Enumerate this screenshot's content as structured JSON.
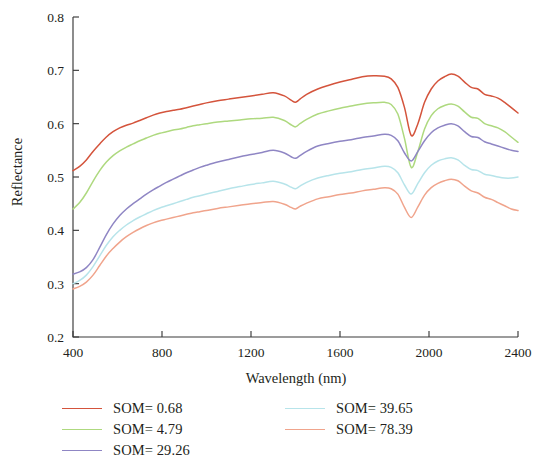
{
  "figure": {
    "background": "#ffffff"
  },
  "axes": {
    "x": {
      "label": "Wavelength (nm)",
      "ticks": [
        400,
        800,
        1200,
        1600,
        2000,
        2400
      ],
      "tick_labels": [
        "400",
        "800",
        "1200",
        "1600",
        "2000",
        "2400"
      ],
      "min": 400,
      "max": 2400
    },
    "y": {
      "label": "Reflectance",
      "ticks": [
        0.2,
        0.3,
        0.4,
        0.5,
        0.6,
        0.7,
        0.8
      ],
      "tick_labels": [
        "0.2",
        "0.3",
        "0.4",
        "0.5",
        "0.6",
        "0.7",
        "0.8"
      ],
      "min": 0.2,
      "max": 0.8
    }
  },
  "legend": {
    "position": "bottom",
    "columns": 2,
    "left_column": [
      {
        "label": "SOM= 0.68",
        "color": "#d4543c",
        "series": "som_0_68"
      },
      {
        "label": "SOM= 4.79",
        "color": "#aed97f",
        "series": "som_4_79"
      },
      {
        "label": "SOM= 29.26",
        "color": "#8f86c4",
        "series": "som_29_26"
      }
    ],
    "right_column": [
      {
        "label": "SOM= 39.65",
        "color": "#b7e4ea",
        "series": "som_39_65"
      },
      {
        "label": "SOM= 78.39",
        "color": "#f0a48c",
        "series": "som_78_39"
      }
    ]
  },
  "chart_data": {
    "type": "line",
    "title": "",
    "xlabel": "Wavelength (nm)",
    "ylabel": "Reflectance",
    "xlim": [
      400,
      2400
    ],
    "ylim": [
      0.2,
      0.8
    ],
    "grid": false,
    "legend_position": "bottom",
    "x": [
      400,
      430,
      460,
      490,
      520,
      550,
      580,
      610,
      640,
      670,
      700,
      730,
      760,
      790,
      820,
      850,
      880,
      910,
      940,
      970,
      1000,
      1050,
      1100,
      1150,
      1200,
      1250,
      1300,
      1350,
      1380,
      1400,
      1420,
      1450,
      1500,
      1550,
      1600,
      1650,
      1700,
      1750,
      1800,
      1830,
      1860,
      1890,
      1920,
      1950,
      1980,
      2010,
      2040,
      2070,
      2100,
      2130,
      2160,
      2190,
      2220,
      2250,
      2280,
      2310,
      2340,
      2370,
      2400
    ],
    "series": [
      {
        "name": "SOM= 0.68",
        "color": "#d4543c",
        "values": [
          0.512,
          0.52,
          0.532,
          0.548,
          0.562,
          0.575,
          0.585,
          0.592,
          0.597,
          0.601,
          0.606,
          0.611,
          0.616,
          0.62,
          0.623,
          0.625,
          0.627,
          0.63,
          0.633,
          0.636,
          0.639,
          0.643,
          0.646,
          0.649,
          0.652,
          0.655,
          0.658,
          0.652,
          0.644,
          0.64,
          0.646,
          0.655,
          0.665,
          0.672,
          0.678,
          0.683,
          0.688,
          0.69,
          0.689,
          0.684,
          0.668,
          0.63,
          0.578,
          0.6,
          0.64,
          0.665,
          0.68,
          0.688,
          0.693,
          0.689,
          0.678,
          0.668,
          0.665,
          0.655,
          0.652,
          0.648,
          0.64,
          0.63,
          0.62
        ]
      },
      {
        "name": "SOM= 4.79",
        "color": "#aed97f",
        "values": [
          0.44,
          0.452,
          0.47,
          0.492,
          0.512,
          0.528,
          0.54,
          0.549,
          0.556,
          0.562,
          0.568,
          0.573,
          0.578,
          0.582,
          0.585,
          0.588,
          0.59,
          0.593,
          0.596,
          0.598,
          0.6,
          0.603,
          0.605,
          0.607,
          0.609,
          0.61,
          0.612,
          0.606,
          0.598,
          0.594,
          0.6,
          0.608,
          0.618,
          0.624,
          0.629,
          0.633,
          0.637,
          0.639,
          0.64,
          0.636,
          0.618,
          0.572,
          0.518,
          0.548,
          0.59,
          0.615,
          0.628,
          0.634,
          0.637,
          0.633,
          0.622,
          0.612,
          0.61,
          0.6,
          0.596,
          0.592,
          0.585,
          0.575,
          0.565
        ]
      },
      {
        "name": "SOM= 29.26",
        "color": "#8f86c4",
        "values": [
          0.318,
          0.322,
          0.33,
          0.345,
          0.368,
          0.392,
          0.412,
          0.428,
          0.44,
          0.45,
          0.459,
          0.468,
          0.476,
          0.483,
          0.49,
          0.496,
          0.502,
          0.508,
          0.513,
          0.518,
          0.522,
          0.528,
          0.533,
          0.538,
          0.542,
          0.546,
          0.55,
          0.545,
          0.538,
          0.535,
          0.54,
          0.548,
          0.558,
          0.563,
          0.567,
          0.57,
          0.574,
          0.577,
          0.58,
          0.578,
          0.568,
          0.545,
          0.53,
          0.548,
          0.568,
          0.583,
          0.592,
          0.597,
          0.6,
          0.596,
          0.585,
          0.576,
          0.574,
          0.566,
          0.562,
          0.558,
          0.554,
          0.55,
          0.548
        ]
      },
      {
        "name": "SOM= 39.65",
        "color": "#b7e4ea",
        "values": [
          0.3,
          0.306,
          0.316,
          0.332,
          0.352,
          0.372,
          0.388,
          0.4,
          0.41,
          0.418,
          0.425,
          0.431,
          0.437,
          0.442,
          0.446,
          0.45,
          0.454,
          0.458,
          0.462,
          0.465,
          0.468,
          0.473,
          0.478,
          0.482,
          0.486,
          0.489,
          0.492,
          0.487,
          0.481,
          0.478,
          0.483,
          0.49,
          0.498,
          0.503,
          0.507,
          0.51,
          0.514,
          0.517,
          0.52,
          0.518,
          0.508,
          0.485,
          0.468,
          0.488,
          0.508,
          0.522,
          0.53,
          0.534,
          0.536,
          0.532,
          0.522,
          0.514,
          0.512,
          0.505,
          0.503,
          0.5,
          0.498,
          0.498,
          0.5
        ]
      },
      {
        "name": "SOM= 78.39",
        "color": "#f0a48c",
        "values": [
          0.29,
          0.295,
          0.303,
          0.316,
          0.334,
          0.352,
          0.366,
          0.378,
          0.388,
          0.396,
          0.403,
          0.409,
          0.414,
          0.418,
          0.421,
          0.424,
          0.427,
          0.43,
          0.433,
          0.435,
          0.437,
          0.441,
          0.444,
          0.447,
          0.45,
          0.452,
          0.454,
          0.449,
          0.443,
          0.44,
          0.445,
          0.451,
          0.459,
          0.463,
          0.467,
          0.47,
          0.474,
          0.477,
          0.48,
          0.478,
          0.468,
          0.443,
          0.424,
          0.444,
          0.466,
          0.48,
          0.488,
          0.493,
          0.496,
          0.493,
          0.483,
          0.474,
          0.47,
          0.462,
          0.458,
          0.452,
          0.446,
          0.44,
          0.437
        ]
      }
    ]
  }
}
